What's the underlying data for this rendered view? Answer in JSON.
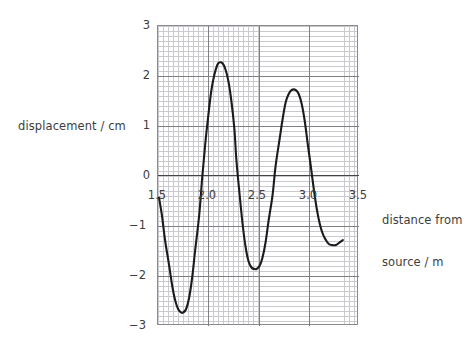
{
  "figure": {
    "background_color": "#ffffff",
    "text_color": "#3d3d3d"
  },
  "axes": {
    "y_title": "displacement / cm",
    "x_title_line1": "distance from",
    "x_title_line2": "source / m",
    "x_ticks": [
      "1.5",
      "2.0",
      "2.5",
      "3.0",
      "3.5"
    ],
    "y_ticks": [
      "3",
      "2",
      "1",
      "0",
      "−1",
      "−2",
      "−3"
    ]
  },
  "chart_data": {
    "type": "line",
    "title": "",
    "subtitle": "",
    "xlabel": "distance from source / m",
    "ylabel": "displacement / cm",
    "xlim": [
      1.5,
      3.5
    ],
    "ylim": [
      -3,
      3
    ],
    "x_major_ticks": [
      1.5,
      2.0,
      2.5,
      3.0,
      3.5
    ],
    "y_major_ticks": [
      -3,
      -2,
      -1,
      0,
      1,
      2,
      3
    ],
    "x_minor_step": 0.05,
    "y_minor_step": 0.1,
    "grid": true,
    "grid_minor": true,
    "legend": false,
    "legend_position": "none",
    "line_color": "#1b1b1b",
    "grid_major_color": "#7e7e86",
    "grid_minor_color": "#c9c9cf",
    "axis_line_color": "#43434a",
    "annotations": [],
    "features": {
      "curve_start": {
        "x": 1.52,
        "y": -0.45
      },
      "curve_end": {
        "x": 3.35,
        "y": -1.3
      },
      "minima": [
        {
          "x": 1.76,
          "y": -2.75
        },
        {
          "x": 2.49,
          "y": -1.88
        },
        {
          "x": 3.28,
          "y": -1.4
        }
      ],
      "maxima": [
        {
          "x": 2.12,
          "y": 2.25
        },
        {
          "x": 2.88,
          "y": 1.7
        }
      ],
      "zero_crossings": [
        1.62,
        1.92,
        2.29,
        2.72,
        3.09
      ]
    },
    "series": [
      {
        "name": "displacement",
        "x": [
          1.52,
          1.55,
          1.58,
          1.62,
          1.65,
          1.68,
          1.71,
          1.74,
          1.76,
          1.79,
          1.82,
          1.85,
          1.88,
          1.92,
          1.95,
          1.98,
          2.01,
          2.04,
          2.07,
          2.1,
          2.12,
          2.15,
          2.18,
          2.21,
          2.24,
          2.27,
          2.29,
          2.32,
          2.35,
          2.38,
          2.41,
          2.44,
          2.47,
          2.49,
          2.52,
          2.55,
          2.58,
          2.61,
          2.65,
          2.68,
          2.72,
          2.75,
          2.78,
          2.81,
          2.84,
          2.88,
          2.91,
          2.94,
          2.97,
          3.0,
          3.03,
          3.06,
          3.09,
          3.12,
          3.15,
          3.18,
          3.21,
          3.24,
          3.28,
          3.31,
          3.35
        ],
        "y": [
          -0.45,
          -0.82,
          -1.3,
          -1.8,
          -2.2,
          -2.5,
          -2.68,
          -2.75,
          -2.75,
          -2.68,
          -2.45,
          -2.05,
          -1.5,
          -0.8,
          -0.05,
          0.62,
          1.18,
          1.68,
          2.0,
          2.2,
          2.25,
          2.24,
          2.12,
          1.88,
          1.48,
          0.92,
          0.3,
          -0.35,
          -0.95,
          -1.42,
          -1.72,
          -1.85,
          -1.88,
          -1.88,
          -1.82,
          -1.65,
          -1.35,
          -0.92,
          -0.4,
          0.18,
          0.72,
          1.12,
          1.45,
          1.62,
          1.7,
          1.7,
          1.62,
          1.42,
          1.08,
          0.62,
          0.18,
          -0.28,
          -0.68,
          -0.98,
          -1.18,
          -1.3,
          -1.38,
          -1.4,
          -1.4,
          -1.36,
          -1.3
        ]
      }
    ]
  }
}
